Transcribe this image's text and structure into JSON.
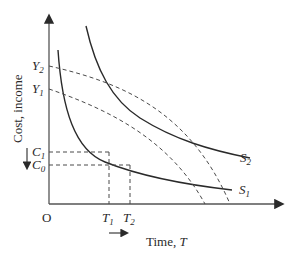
{
  "diagram": {
    "type": "economics-curve-diagram",
    "axes": {
      "origin_label": "O",
      "y_axis_label": "Cost, income",
      "x_axis_label": "Time, T",
      "x_axis_label_prefix": "Time, ",
      "x_axis_label_var": "T"
    },
    "y_ticks": [
      {
        "base": "Y",
        "sub": "2"
      },
      {
        "base": "Y",
        "sub": "1"
      },
      {
        "base": "C",
        "sub": "1"
      },
      {
        "base": "C",
        "sub": "0"
      }
    ],
    "x_ticks": [
      {
        "base": "T",
        "sub": "1"
      },
      {
        "base": "T",
        "sub": "2"
      }
    ],
    "curves": [
      {
        "base": "S",
        "sub": "2",
        "style": "solid"
      },
      {
        "base": "S",
        "sub": "1",
        "style": "solid"
      }
    ],
    "income_lines": [
      {
        "from": "Y2",
        "style": "dashed"
      },
      {
        "from": "Y1",
        "style": "dashed"
      }
    ],
    "arrows": {
      "cost_decrease": "down arrow beside C1/C0",
      "time_increase": "right arrow below T1/T2"
    },
    "colors": {
      "line": "#2a2a2a",
      "dashed": "#4a4a4a",
      "axis": "#555555"
    }
  }
}
